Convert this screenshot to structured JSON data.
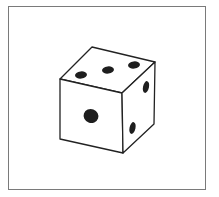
{
  "figure": {
    "faces": {
      "top": {
        "pips": 3
      },
      "front": {
        "pips": 1
      },
      "right": {
        "pips": 2
      }
    },
    "colors": {
      "frame": "#7a7a7a",
      "outline": "#222222",
      "pip": "#1e1e1e",
      "background": "#ffffff"
    }
  }
}
